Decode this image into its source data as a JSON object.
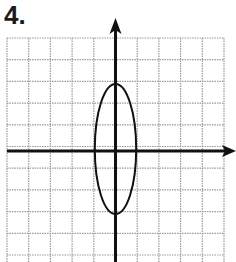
{
  "problem": {
    "number_label": "4."
  },
  "graph": {
    "grid": {
      "columns": 10,
      "rows": 10,
      "left": 7,
      "top": 38,
      "cell": 21.7,
      "line_color": "#9a9a9a"
    },
    "axes": {
      "origin_col": 5,
      "origin_row": 5.25,
      "color": "#111111",
      "x_arrow": "right",
      "y_arrow": "up"
    },
    "ellipse": {
      "center_x": 0,
      "center_y": 0,
      "semi_axis_x": 1,
      "semi_axis_y": 3,
      "equation": "x^2/1 + y^2/9 = 1",
      "color": "#111111"
    }
  }
}
